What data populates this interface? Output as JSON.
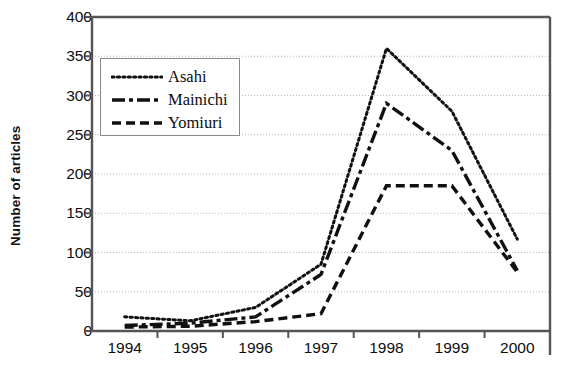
{
  "chart_data": {
    "type": "line",
    "title": "",
    "xlabel": "",
    "ylabel": "Number of articles",
    "categories": [
      "1994",
      "1995",
      "1996",
      "1997",
      "1998",
      "1999",
      "2000"
    ],
    "x": [
      1994,
      1995,
      1996,
      1997,
      1998,
      1999,
      2000
    ],
    "ylim": [
      0,
      400
    ],
    "ytick_values": [
      0,
      50,
      100,
      150,
      200,
      250,
      300,
      350,
      400
    ],
    "ytick_labels": [
      "0",
      "50",
      "100",
      "150",
      "200",
      "250",
      "300",
      "350",
      "400"
    ],
    "grid": "horizontal-dotted",
    "legend_position": "upper-left-inside",
    "series": [
      {
        "name": "Asahi",
        "style": "dotted",
        "values": [
          18,
          13,
          30,
          85,
          360,
          280,
          117
        ]
      },
      {
        "name": "Mainichi",
        "style": "dash-dot",
        "values": [
          7,
          10,
          18,
          72,
          290,
          230,
          77
        ]
      },
      {
        "name": "Yomiuri",
        "style": "dashed",
        "values": [
          5,
          6,
          12,
          22,
          185,
          185,
          75
        ]
      }
    ]
  },
  "axes": {
    "y_title": "Number of articles"
  },
  "legend": {
    "entries": [
      {
        "label": "Asahi",
        "style": "dotted"
      },
      {
        "label": "Mainichi",
        "style": "dash-dot"
      },
      {
        "label": "Yomiuri",
        "style": "dashed"
      }
    ]
  },
  "colors": {
    "line": "#101010",
    "frame": "#555555",
    "grid": "#b9b9b9",
    "text": "#0d0d0d",
    "background": "#ffffff"
  }
}
